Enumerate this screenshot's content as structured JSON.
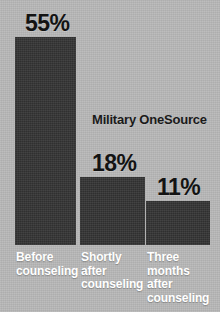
{
  "chart_data": {
    "type": "bar",
    "title": "",
    "subtitle": "",
    "xlabel": "",
    "ylabel": "",
    "annotation": "Military OneSource",
    "categories": [
      "Before counseling",
      "Shortly after counseling",
      "Three months after counseling"
    ],
    "category_lines": [
      [
        "Before",
        "counseling"
      ],
      [
        "Shortly",
        "after",
        "counseling"
      ],
      [
        "Three",
        "months",
        "after",
        "counseling"
      ]
    ],
    "values": [
      55,
      18,
      11
    ],
    "value_labels": [
      "55%",
      "18%",
      "11%"
    ],
    "ylim": [
      0,
      55
    ],
    "grid": false,
    "legend": "none",
    "units": "percent"
  },
  "style": {
    "background_color": "#b9b9b9",
    "bar_color": "#343434",
    "value_label_color": "#131313",
    "category_label_color": "#ffffff",
    "annotation_color": "#1a1a1a"
  },
  "geometry": {
    "baseline_y": 245,
    "bars": [
      {
        "x": 15,
        "width": 61,
        "top": 37
      },
      {
        "x": 80,
        "width": 65,
        "top": 177
      },
      {
        "x": 146,
        "width": 64,
        "top": 201
      }
    ],
    "value_label_positions": [
      {
        "x": 25,
        "y": 11
      },
      {
        "x": 92,
        "y": 151
      },
      {
        "x": 157,
        "y": 175
      }
    ],
    "category_label_positions": [
      {
        "x": 16,
        "y": 251
      },
      {
        "x": 81,
        "y": 251
      },
      {
        "x": 147,
        "y": 251
      }
    ]
  }
}
